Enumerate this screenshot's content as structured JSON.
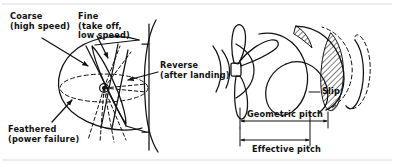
{
  "figure": {
    "ink_color": "#111111",
    "background_color": "#ffffff"
  },
  "left_diagram": {
    "name": "variable-pitch-propeller-blade-angles",
    "labels": {
      "coarse": "Coarse\n(high speed)",
      "fine": "Fine\n(take off,\nlow speed)",
      "reverse": "Reverse\n(after landing)",
      "feathered": "Feathered\n(power failure)"
    }
  },
  "right_diagram": {
    "name": "geometric-and-effective-pitch",
    "labels": {
      "slip": "Slip",
      "geometric_pitch": "Geometric pitch",
      "effective_pitch": "Effective pitch"
    }
  }
}
